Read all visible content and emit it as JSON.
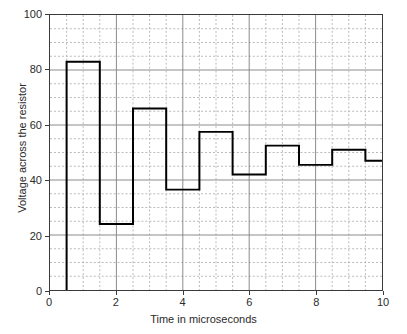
{
  "chart_data": {
    "type": "line",
    "title": "",
    "xlabel": "Time in microseconds",
    "ylabel": "Voltage across the resistor",
    "xlim": [
      0,
      10
    ],
    "ylim": [
      0,
      100
    ],
    "xticks": [
      0,
      2,
      4,
      6,
      8,
      10
    ],
    "xtick_labels": [
      "0",
      "2",
      "4",
      "6",
      "8",
      "10"
    ],
    "yticks": [
      0,
      20,
      40,
      60,
      80,
      100
    ],
    "ytick_labels": [
      "0",
      "20",
      "40",
      "60",
      "80",
      "100"
    ],
    "grid": true,
    "grid_major_x_step": 2,
    "grid_major_y_step": 20,
    "grid_minor_x_step": 0.5,
    "grid_minor_y_step": 5,
    "legend": "none",
    "line_color": "#000000",
    "line_width": 2,
    "drawstyle": "steps-post",
    "series": [
      {
        "name": "Voltage",
        "x": [
          0.5,
          1.5,
          2.5,
          3.5,
          4.5,
          5.5,
          6.5,
          7.5,
          8.5,
          9.5,
          10.0
        ],
        "values": [
          83,
          24,
          66,
          36.5,
          57.5,
          42,
          52.5,
          45.5,
          51,
          47,
          47
        ]
      }
    ],
    "steps": [
      {
        "x_start": 0.5,
        "x_end": 1.5,
        "y": 83
      },
      {
        "x_start": 1.5,
        "x_end": 2.5,
        "y": 24
      },
      {
        "x_start": 2.5,
        "x_end": 3.5,
        "y": 66
      },
      {
        "x_start": 3.5,
        "x_end": 4.5,
        "y": 36.5
      },
      {
        "x_start": 4.5,
        "x_end": 5.5,
        "y": 57.5
      },
      {
        "x_start": 5.5,
        "x_end": 6.5,
        "y": 42
      },
      {
        "x_start": 6.5,
        "x_end": 7.5,
        "y": 52.5
      },
      {
        "x_start": 7.5,
        "x_end": 8.5,
        "y": 45.5
      },
      {
        "x_start": 8.5,
        "x_end": 9.5,
        "y": 51
      },
      {
        "x_start": 9.5,
        "x_end": 10.0,
        "y": 47
      }
    ],
    "baseline_start_x": 0.5,
    "baseline_y": 0
  }
}
